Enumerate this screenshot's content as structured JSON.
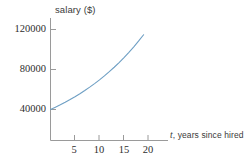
{
  "chart_data": {
    "type": "line",
    "title": "",
    "xlabel": "t, years since hired",
    "xlabel_var": "t",
    "xlabel_rest": ", years since hired",
    "ylabel": "salary ($)",
    "xlim": [
      0,
      22
    ],
    "ylim": [
      0,
      130000
    ],
    "xticks": [
      5,
      10,
      15,
      20
    ],
    "xtick_labels": [
      "5",
      "10",
      "15",
      "20"
    ],
    "yticks": [
      40000,
      80000,
      120000
    ],
    "ytick_labels": [
      "40000",
      "80000",
      "120000"
    ],
    "grid": false,
    "legend": false,
    "series": [
      {
        "name": "salary",
        "color": "#6e9fc4",
        "x": [
          0,
          1,
          2,
          3,
          4,
          5,
          6,
          7,
          8,
          9,
          10,
          11,
          12,
          13,
          14,
          15,
          16,
          17,
          18,
          19
        ],
        "values": [
          40000,
          42280,
          44690,
          47240,
          49930,
          52780,
          55790,
          58970,
          62330,
          65890,
          69650,
          73620,
          77820,
          82260,
          86950,
          91910,
          97150,
          102690,
          108550,
          114740
        ]
      }
    ]
  },
  "axes": {
    "y_title": "salary ($)",
    "x_title_var": "t",
    "x_title_rest": ", years since hired"
  },
  "ticks": {
    "y": [
      {
        "label": "120000"
      },
      {
        "label": "80000"
      },
      {
        "label": "40000"
      }
    ],
    "x": [
      {
        "label": "5"
      },
      {
        "label": "10"
      },
      {
        "label": "15"
      },
      {
        "label": "20"
      }
    ]
  },
  "colors": {
    "curve": "#6e9fc4",
    "axis": "#9a9a9a",
    "text": "#2e2e2e"
  }
}
